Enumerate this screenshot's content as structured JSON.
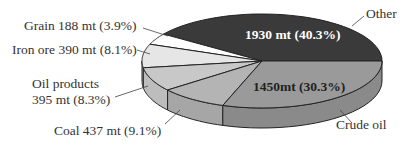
{
  "chart_data": {
    "type": "pie",
    "style": "3d-pie",
    "title": "",
    "unit": "mt",
    "slices": [
      {
        "name": "Other",
        "value": 1930,
        "percent": 40.3,
        "label": "Other",
        "inner_label": "1930 mt (40.3%)",
        "color": "#3a3a3a",
        "side": "#3a3a3a"
      },
      {
        "name": "Crude oil",
        "value": 1450,
        "percent": 30.3,
        "label": "Crude oil",
        "inner_label": "1450mt (30.3%)",
        "color": "#9a9a9a",
        "side": "#8a8a8a"
      },
      {
        "name": "Coal",
        "value": 437,
        "percent": 9.1,
        "label": "Coal 437 mt (9.1%)",
        "color": "#b4b4b4",
        "side": "#a6a6a6"
      },
      {
        "name": "Oil products",
        "value": 395,
        "percent": 8.3,
        "label_line1": "Oil products",
        "label_line2": "395 mt (8.3%)",
        "color": "#c8c8c8",
        "side": "#bdbdbd"
      },
      {
        "name": "Iron ore",
        "value": 390,
        "percent": 8.1,
        "label": "Iron ore 390 mt (8.1%)",
        "color": "#e6e6e6",
        "side": "#d6d6d6"
      },
      {
        "name": "Grain",
        "value": 188,
        "percent": 3.9,
        "label": "Grain 188 mt (3.9%)",
        "color": "#ffffff",
        "side": "#f0f0f0"
      }
    ],
    "legend": "none (callout labels)"
  }
}
